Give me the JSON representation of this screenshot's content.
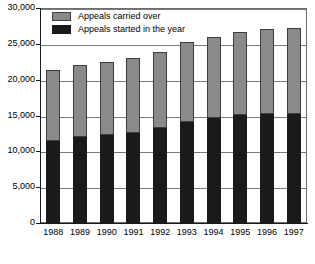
{
  "chart_data": {
    "type": "bar",
    "subtype": "stacked-vertical",
    "title": "",
    "xlabel": "",
    "ylabel": "",
    "categories": [
      "1988",
      "1989",
      "1990",
      "1991",
      "1992",
      "1993",
      "1994",
      "1995",
      "1996",
      "1997"
    ],
    "series": [
      {
        "name": "Appeals started in the year",
        "color": "#1a1a1a",
        "values": [
          11400,
          12000,
          12300,
          12600,
          13300,
          14100,
          14700,
          15000,
          15200,
          15200
        ]
      },
      {
        "name": "Appeals carried over",
        "color": "#8a8a8a",
        "values": [
          10000,
          10000,
          10200,
          10400,
          10500,
          11100,
          11300,
          11700,
          11900,
          12000
        ]
      }
    ],
    "totals": [
      21400,
      22000,
      22500,
      23000,
      23800,
      25200,
      26000,
      26700,
      27100,
      27200
    ],
    "ylim": [
      0,
      30000
    ],
    "yticks": [
      0,
      5000,
      10000,
      15000,
      20000,
      25000,
      30000
    ],
    "ytick_labels": [
      "0",
      "5,000",
      "10,000",
      "15,000",
      "20,000",
      "25,000",
      "30,000"
    ],
    "grid": true,
    "grid_axis": "y",
    "legend_position": "top-left",
    "legend": [
      "Appeals carried over",
      "Appeals started in the year"
    ]
  },
  "legend": {
    "items": [
      {
        "label": "Appeals carried over",
        "swatch": "grey-swatch-icon"
      },
      {
        "label": "Appeals started in the year",
        "swatch": "black-swatch-icon"
      }
    ]
  }
}
